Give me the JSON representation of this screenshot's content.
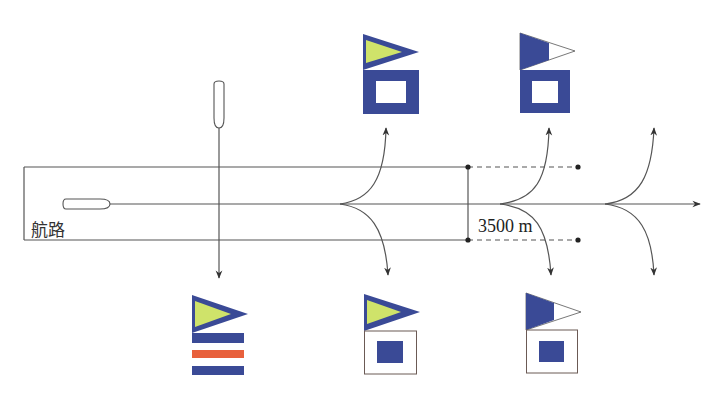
{
  "diagram": {
    "channel_label": "航路",
    "distance_label": "3500 m",
    "colors": {
      "line": "#555555",
      "flag_blue": "#3a4a96",
      "flag_yellow": "#cfe36a",
      "flag_red": "#e8603c",
      "white": "#ffffff"
    },
    "flags": [
      {
        "id": "top-1",
        "pennant": "yellow-blue-border",
        "board": "blue-with-white-center"
      },
      {
        "id": "top-2",
        "pennant": "blue-white-split",
        "board": "blue-with-white-center"
      },
      {
        "id": "bottom-1",
        "pennant": "yellow-blue-border",
        "board": "blue-white-red-stripes"
      },
      {
        "id": "bottom-2",
        "pennant": "yellow-blue-border",
        "board": "white-with-blue-center"
      },
      {
        "id": "bottom-3",
        "pennant": "blue-white-split",
        "board": "white-with-blue-center"
      }
    ]
  }
}
